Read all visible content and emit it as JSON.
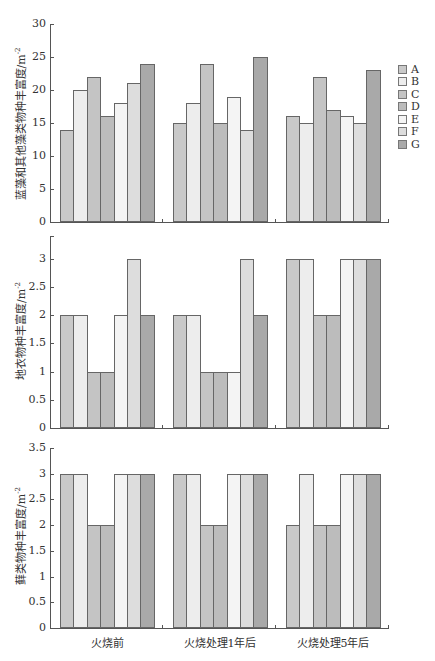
{
  "colors": {
    "A": "#c9c9c9",
    "B": "#ededed",
    "C": "#c4c4c4",
    "D": "#bcbcbc",
    "E": "#f4f4f4",
    "F": "#dddddd",
    "G": "#a9a9a9"
  },
  "legend": [
    "A",
    "B",
    "C",
    "D",
    "E",
    "F",
    "G"
  ],
  "categories": [
    "火烧前",
    "火烧处理1年后",
    "火烧处理5年后"
  ],
  "chart_data": [
    {
      "type": "bar",
      "title": "",
      "ylabel": "蓝藻和其他藻类物种丰富度/m⁻²",
      "xlabel": "",
      "ylim": [
        0,
        30
      ],
      "yticks": [
        0,
        5,
        10,
        15,
        20,
        25,
        30
      ],
      "categories": [
        "火烧前",
        "火烧处理1年后",
        "火烧处理5年后"
      ],
      "series": [
        {
          "name": "A",
          "values": [
            14,
            15,
            16
          ]
        },
        {
          "name": "B",
          "values": [
            20,
            18,
            15
          ]
        },
        {
          "name": "C",
          "values": [
            22,
            24,
            22
          ]
        },
        {
          "name": "D",
          "values": [
            16,
            15,
            17
          ]
        },
        {
          "name": "E",
          "values": [
            18,
            19,
            16
          ]
        },
        {
          "name": "F",
          "values": [
            21,
            14,
            15
          ]
        },
        {
          "name": "G",
          "values": [
            24,
            25,
            23
          ]
        }
      ],
      "legend_position": "right"
    },
    {
      "type": "bar",
      "title": "",
      "ylabel": "地衣物种丰富度/m⁻²",
      "xlabel": "",
      "ylim": [
        0,
        3.5
      ],
      "yticks": [
        0,
        0.5,
        1,
        1.5,
        2,
        2.5,
        3
      ],
      "categories": [
        "火烧前",
        "火烧处理1年后",
        "火烧处理5年后"
      ],
      "series": [
        {
          "name": "A",
          "values": [
            2,
            2,
            3
          ]
        },
        {
          "name": "B",
          "values": [
            2,
            2,
            3
          ]
        },
        {
          "name": "C",
          "values": [
            1,
            1,
            2
          ]
        },
        {
          "name": "D",
          "values": [
            1,
            1,
            2
          ]
        },
        {
          "name": "E",
          "values": [
            2,
            1,
            3
          ]
        },
        {
          "name": "F",
          "values": [
            3,
            3,
            3
          ]
        },
        {
          "name": "G",
          "values": [
            2,
            2,
            3
          ]
        }
      ]
    },
    {
      "type": "bar",
      "title": "",
      "ylabel": "藓类物种丰富度/m⁻²",
      "xlabel": "",
      "ylim": [
        0,
        3.5
      ],
      "yticks": [
        0,
        0.5,
        1,
        1.5,
        2,
        2.5,
        3,
        3.5
      ],
      "categories": [
        "火烧前",
        "火烧处理1年后",
        "火烧处理5年后"
      ],
      "series": [
        {
          "name": "A",
          "values": [
            3,
            3,
            2
          ]
        },
        {
          "name": "B",
          "values": [
            3,
            3,
            3
          ]
        },
        {
          "name": "C",
          "values": [
            2,
            2,
            2
          ]
        },
        {
          "name": "D",
          "values": [
            2,
            2,
            2
          ]
        },
        {
          "name": "E",
          "values": [
            3,
            3,
            3
          ]
        },
        {
          "name": "F",
          "values": [
            3,
            3,
            3
          ]
        },
        {
          "name": "G",
          "values": [
            3,
            3,
            3
          ]
        }
      ]
    }
  ],
  "layout": [
    {
      "top": 24,
      "zero": 222,
      "max": 30,
      "ylabel_y": 123
    },
    {
      "top": 236,
      "zero": 428,
      "max": 3.4,
      "ylabel_y": 330
    },
    {
      "top": 448,
      "zero": 628,
      "max": 3.5,
      "ylabel_y": 535
    }
  ]
}
